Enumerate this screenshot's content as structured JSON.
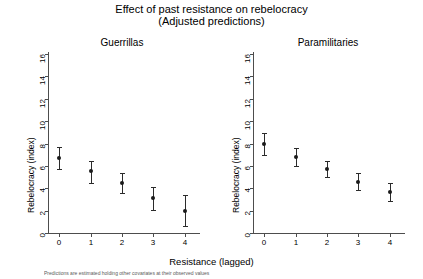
{
  "title": {
    "line1": "Effect of past resistance on rebelocracy",
    "line2": "(Adjusted predictions)"
  },
  "axis_caption_x": "Resistance (lagged)",
  "axis_caption_y": "Rebelocracy (index)",
  "footnote": "Predictions are estimated holding other covariates at their observed values",
  "panels": [
    {
      "key": "guerrillas",
      "title": "Guerrillas"
    },
    {
      "key": "paramilitaries",
      "title": "Paramilitaries"
    }
  ],
  "ticks": {
    "y": [
      "0",
      "2",
      "4",
      "6",
      "8",
      "10",
      "12",
      "14",
      "16"
    ],
    "x": [
      "0",
      "1",
      "2",
      "3",
      "4"
    ]
  },
  "colors": {
    "marker": "#1a1a1a",
    "ci": "#2b2b2b",
    "axis": "#4d4d4d",
    "background": "#ffffff",
    "text": "#000000"
  },
  "chart_data": {
    "type": "scatter",
    "title": "Effect of past resistance on rebelocracy (Adjusted predictions)",
    "xlabel": "Resistance (lagged)",
    "ylabel": "Rebelocracy (index)",
    "xlim": [
      -0.35,
      4.35
    ],
    "ylim": [
      0,
      16
    ],
    "yticks": [
      0,
      2,
      4,
      6,
      8,
      10,
      12,
      14,
      16
    ],
    "xticks": [
      0,
      1,
      2,
      3,
      4
    ],
    "grid": false,
    "legend": "none",
    "error_bars": "95% confidence interval",
    "panels": [
      {
        "name": "Guerrillas",
        "x": [
          0,
          1,
          2,
          3,
          4
        ],
        "values": [
          6.7,
          5.5,
          4.5,
          3.1,
          2.0
        ],
        "ci_low": [
          5.7,
          4.5,
          3.6,
          2.1,
          0.6
        ],
        "ci_high": [
          7.7,
          6.4,
          5.4,
          4.1,
          3.4
        ]
      },
      {
        "name": "Paramilitaries",
        "x": [
          0,
          1,
          2,
          3,
          4
        ],
        "values": [
          8.0,
          6.8,
          5.7,
          4.6,
          3.7
        ],
        "ci_low": [
          7.0,
          6.0,
          5.0,
          3.8,
          2.9
        ],
        "ci_high": [
          8.9,
          7.6,
          6.4,
          5.4,
          4.5
        ]
      }
    ]
  }
}
